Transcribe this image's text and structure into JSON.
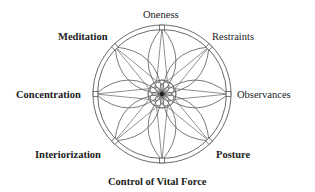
{
  "diagram": {
    "labels": [
      {
        "id": "oneness",
        "text": "Oneness",
        "bold": false
      },
      {
        "id": "restraints",
        "text": "Restraints",
        "bold": false
      },
      {
        "id": "observances",
        "text": "Observances",
        "bold": false
      },
      {
        "id": "posture",
        "text": "Posture",
        "bold": true
      },
      {
        "id": "control-of-vital-force",
        "text": "Control of Vital Force",
        "bold": true
      },
      {
        "id": "interiorization",
        "text": "Interiorization",
        "bold": true
      },
      {
        "id": "concentration",
        "text": "Concentration",
        "bold": true
      },
      {
        "id": "meditation",
        "text": "Meditation",
        "bold": true
      }
    ],
    "petal_count": 8,
    "stroke_color": "#444444"
  }
}
